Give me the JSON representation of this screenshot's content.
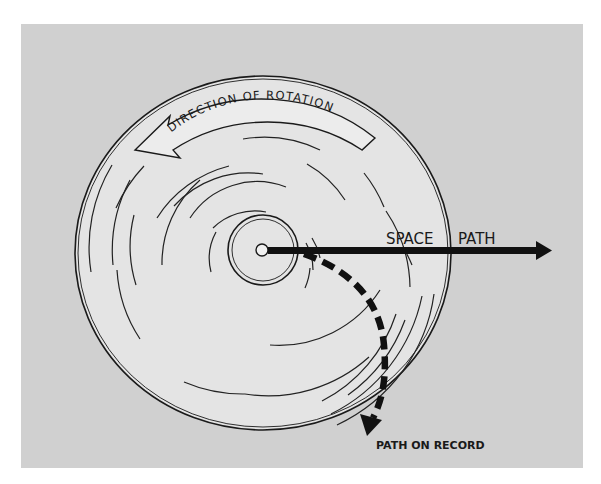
{
  "figure": {
    "labels": {
      "rotation": "DIRECTION OF ROTATION",
      "space_path_word1": "SPACE",
      "space_path_word2": "PATH",
      "path_on_record": "PATH ON RECORD"
    },
    "colors": {
      "background": "#ffffff",
      "panel": "#d0d0d0",
      "disc": "#e4e4e4",
      "ink": "#1a1a1a"
    },
    "elements": [
      "disc",
      "label-ring",
      "center-hole",
      "groove-arcs",
      "rotation-arrow",
      "space-path-arrow",
      "record-path-dashed-arrow"
    ]
  }
}
